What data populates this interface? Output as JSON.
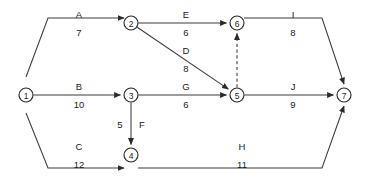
{
  "chart_data": {
    "type": "diagram",
    "diagram_type": "activity-on-arrow-network",
    "title": "",
    "nodes": [
      {
        "id": "1",
        "label": "1",
        "x": 26,
        "y": 95
      },
      {
        "id": "2",
        "label": "2",
        "x": 131,
        "y": 23
      },
      {
        "id": "3",
        "label": "3",
        "x": 131,
        "y": 95
      },
      {
        "id": "4",
        "label": "4",
        "x": 131,
        "y": 155
      },
      {
        "id": "5",
        "label": "5",
        "x": 237,
        "y": 95
      },
      {
        "id": "6",
        "label": "6",
        "x": 237,
        "y": 23
      },
      {
        "id": "7",
        "label": "7",
        "x": 344,
        "y": 95
      }
    ],
    "edges": [
      {
        "name": "A",
        "value": "7",
        "from": "1",
        "to": "2",
        "style": "solid",
        "label_x": 79,
        "label_y": 18,
        "value_x": 79,
        "value_y": 36
      },
      {
        "name": "B",
        "value": "10",
        "from": "1",
        "to": "3",
        "style": "solid",
        "label_x": 79,
        "label_y": 90,
        "value_x": 79,
        "value_y": 108
      },
      {
        "name": "C",
        "value": "12",
        "from": "1",
        "to": "4",
        "style": "solid",
        "label_x": 79,
        "label_y": 150,
        "value_x": 79,
        "value_y": 168
      },
      {
        "name": "E",
        "value": "6",
        "from": "2",
        "to": "6",
        "style": "solid",
        "label_x": 186,
        "label_y": 18,
        "value_x": 186,
        "value_y": 36
      },
      {
        "name": "D",
        "value": "8",
        "from": "2",
        "to": "5",
        "style": "solid",
        "label_x": 186,
        "label_y": 54,
        "value_x": 186,
        "value_y": 72
      },
      {
        "name": "F",
        "value": "5",
        "from": "3",
        "to": "4",
        "style": "solid",
        "label_x": 142,
        "label_y": 128,
        "value_x": 120,
        "value_y": 128
      },
      {
        "name": "G",
        "value": "6",
        "from": "3",
        "to": "5",
        "style": "solid",
        "label_x": 186,
        "label_y": 90,
        "value_x": 186,
        "value_y": 108
      },
      {
        "name": "I",
        "value": "8",
        "from": "6",
        "to": "7",
        "style": "solid",
        "label_x": 293,
        "label_y": 18,
        "value_x": 293,
        "value_y": 36
      },
      {
        "name": "J",
        "value": "9",
        "from": "5",
        "to": "7",
        "style": "solid",
        "label_x": 293,
        "label_y": 90,
        "value_x": 293,
        "value_y": 108
      },
      {
        "name": "H",
        "value": "11",
        "from": "4",
        "to": "7",
        "style": "solid",
        "label_x": 242,
        "label_y": 150,
        "value_x": 242,
        "value_y": 168
      },
      {
        "name": "",
        "value": "",
        "from": "5",
        "to": "6",
        "style": "dashed",
        "label_x": 0,
        "label_y": 0,
        "value_x": 0,
        "value_y": 0
      }
    ],
    "colors": {
      "background": "#ffffff",
      "line": "#3a3a3a",
      "node_stroke": "#2b2b2b",
      "node_fill": "#ffffff",
      "text": "#1a1a1a"
    },
    "node_radius": 7
  }
}
